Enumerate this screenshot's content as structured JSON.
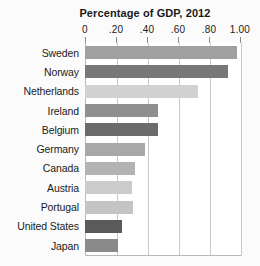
{
  "chart": {
    "title": "Percentage of GDP, 2012",
    "axis_top": true
  },
  "chart_data": {
    "type": "bar",
    "orientation": "horizontal",
    "title": "Percentage of GDP, 2012",
    "xlabel": "",
    "ylabel": "",
    "xlim": [
      0,
      1.0
    ],
    "xticks": [
      0,
      0.2,
      0.4,
      0.6,
      0.8,
      1.0
    ],
    "xtick_labels": [
      "0",
      ".20",
      ".40",
      ".60",
      ".80",
      "1.00"
    ],
    "grid": true,
    "legend": "none",
    "categories": [
      "Sweden",
      "Norway",
      "Netherlands",
      "Ireland",
      "Belgium",
      "Germany",
      "Canada",
      "Austria",
      "Portugal",
      "United States",
      "Japan"
    ],
    "values": [
      0.98,
      0.92,
      0.73,
      0.47,
      0.47,
      0.39,
      0.32,
      0.3,
      0.31,
      0.24,
      0.21
    ],
    "bar_colors": [
      "#a0a0a0",
      "#787878",
      "#d2d2d2",
      "#8f8f8f",
      "#6b6b6b",
      "#a8a8a8",
      "#b3b3b3",
      "#cccccc",
      "#c4c4c4",
      "#5a5a5a",
      "#8a8a8a"
    ]
  },
  "colors": {
    "background": "#fbfbfb",
    "plot_background": "#ffffff",
    "gridline": "#c8c8c8",
    "axis": "#b9b9b9",
    "text": "#1a1a1a"
  }
}
